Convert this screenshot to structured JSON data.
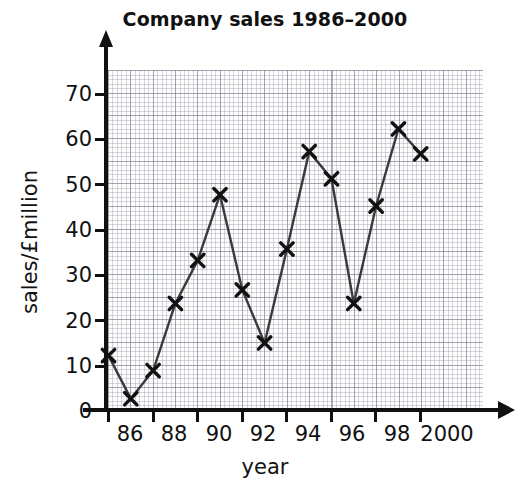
{
  "chart_data": {
    "type": "line",
    "title": "Company sales 1986–2000",
    "xlabel": "year",
    "ylabel": "sales/£million",
    "categories": [
      "1986",
      "1987",
      "1988",
      "1989",
      "1990",
      "1991",
      "1992",
      "1993",
      "1994",
      "1995",
      "1996",
      "1997",
      "1998",
      "1999",
      "2000"
    ],
    "x": [
      1986,
      1987,
      1988,
      1989,
      1990,
      1991,
      1992,
      1993,
      1994,
      1995,
      1996,
      1997,
      1998,
      1999,
      2000
    ],
    "values": [
      12,
      2.5,
      8.7,
      23.5,
      33,
      47.5,
      26.5,
      14.8,
      35.5,
      57,
      51,
      23.5,
      45,
      62,
      56.5
    ],
    "xlim": [
      1985,
      2002
    ],
    "ylim": [
      0,
      75
    ],
    "y_ticks": [
      0,
      10,
      20,
      30,
      40,
      50,
      60,
      70
    ],
    "y_tick_labels": [
      "0",
      "10",
      "20",
      "30",
      "40",
      "50",
      "60",
      "70"
    ],
    "x_ticks": [
      1986,
      1988,
      1990,
      1992,
      1994,
      1996,
      1998,
      2000
    ],
    "x_tick_labels": [
      "86",
      "88",
      "90",
      "92",
      "94",
      "96",
      "98",
      "2000"
    ],
    "grid": true,
    "grid_style": "graph-paper-2mm",
    "legend": false,
    "marker": "x-cross",
    "line_color": "#3a3a3a",
    "marker_color": "#111111",
    "grid_color": "#9aa0b0",
    "axis_color": "#111111",
    "background_color": "#ffffff"
  }
}
